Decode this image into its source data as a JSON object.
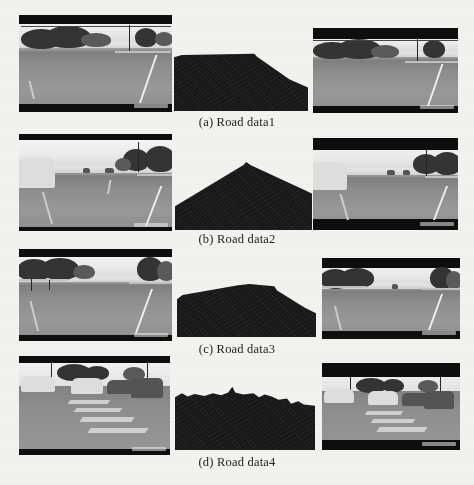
{
  "figure": {
    "background_color": "#f2f2ef",
    "caption_color": "#1d1d1d",
    "mask_color": "#171717",
    "rows": [
      {
        "id": "row-a",
        "caption": "(a) Road data1",
        "input_label": "road scene input image 1",
        "mask_label": "road segmentation mask 1",
        "output_label": "road scene result image 1"
      },
      {
        "id": "row-b",
        "caption": "(b) Road data2",
        "input_label": "road scene input image 2",
        "mask_label": "road segmentation mask 2",
        "output_label": "road scene result image 2"
      },
      {
        "id": "row-c",
        "caption": "(c) Road data3",
        "input_label": "road scene input image 3",
        "mask_label": "road segmentation mask 3",
        "output_label": "road scene result image 3"
      },
      {
        "id": "row-d",
        "caption": "(d) Road data4",
        "input_label": "road scene input image 4",
        "mask_label": "road segmentation mask 4",
        "output_label": "road scene result image 4"
      }
    ]
  }
}
